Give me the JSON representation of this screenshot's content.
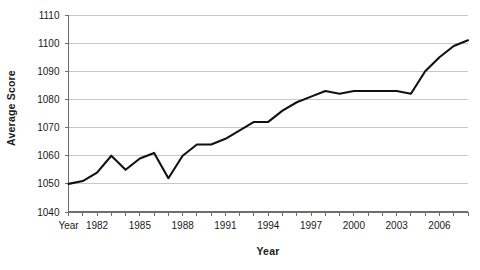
{
  "chart_data": {
    "type": "line",
    "title": "",
    "xlabel": "Year",
    "ylabel": "Average Score",
    "xlim": [
      1980,
      2008
    ],
    "ylim": [
      1040,
      1110
    ],
    "grid": true,
    "legend": "none",
    "y_ticks": [
      1040,
      1050,
      1060,
      1070,
      1080,
      1090,
      1100,
      1110
    ],
    "y_tick_labels": [
      "1040",
      "1050",
      "1060",
      "1070",
      "1080",
      "1090",
      "1100",
      "1110"
    ],
    "x_ticks": [
      1980,
      1981,
      1982,
      1983,
      1984,
      1985,
      1986,
      1987,
      1988,
      1989,
      1990,
      1991,
      1992,
      1993,
      1994,
      1995,
      1996,
      1997,
      1998,
      1999,
      2000,
      2001,
      2002,
      2003,
      2004,
      2005,
      2006,
      2007,
      2008
    ],
    "x_tick_labels": [
      "Year",
      "",
      "1982",
      "",
      "",
      "1985",
      "",
      "",
      "1988",
      "",
      "",
      "1991",
      "",
      "",
      "1994",
      "",
      "",
      "1997",
      "",
      "",
      "2000",
      "",
      "",
      "2003",
      "",
      "",
      "2006",
      "",
      ""
    ],
    "x": [
      1980,
      1981,
      1982,
      1983,
      1984,
      1985,
      1986,
      1987,
      1988,
      1989,
      1990,
      1991,
      1992,
      1993,
      1994,
      1995,
      1996,
      1997,
      1998,
      1999,
      2000,
      2001,
      2002,
      2003,
      2004,
      2005,
      2006,
      2007,
      2008
    ],
    "values": [
      1050,
      1051,
      1054,
      1060,
      1055,
      1059,
      1061,
      1052,
      1060,
      1064,
      1064,
      1066,
      1069,
      1072,
      1072,
      1076,
      1079,
      1081,
      1083,
      1082,
      1083,
      1083,
      1083,
      1083,
      1082,
      1090,
      1095,
      1099,
      1101
    ],
    "series_name": "Average Score",
    "line_color": "#111111",
    "grid_color": "#b9b9b9",
    "axis_color": "#6e6e6e",
    "background_color": "#ffffff"
  }
}
